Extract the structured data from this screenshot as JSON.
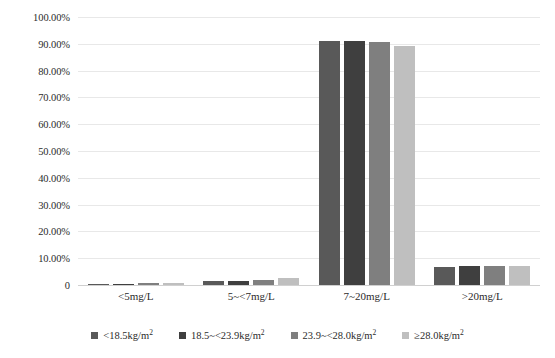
{
  "chart_data": {
    "type": "bar",
    "title": "",
    "xlabel": "",
    "ylabel": "",
    "ylim": [
      0,
      1.0
    ],
    "grid": true,
    "legend_position": "bottom",
    "categories": [
      "<5mg/L",
      "5~<7mg/L",
      "7~20mg/L",
      ">20mg/L"
    ],
    "ytick_labels": [
      "100.00%",
      "90.00%",
      "80.00%",
      "70.00%",
      "60.00%",
      "50.00%",
      "40.00%",
      "30.00%",
      "20.00%",
      "10.00%",
      "0"
    ],
    "ytick_values": [
      1.0,
      0.9,
      0.8,
      0.7,
      0.6,
      0.5,
      0.4,
      0.3,
      0.2,
      0.1,
      0
    ],
    "series": [
      {
        "name": "<18.5kg/m2",
        "name_base": "<18.5kg/m",
        "name_sup": "2",
        "color": "#595959",
        "values": [
          0.003,
          0.015,
          0.912,
          0.069
        ],
        "value_labels": [
          "0.30%",
          "1.50%",
          "91.20%",
          "6.90%"
        ]
      },
      {
        "name": "18.5~<23.9kg/m2",
        "name_base": "18.5~<23.9kg/m",
        "name_sup": "2",
        "color": "#3f3f3f",
        "values": [
          0.004,
          0.016,
          0.912,
          0.07
        ],
        "value_labels": [
          "0.40%",
          "1.60%",
          "91.20%",
          "7.00%"
        ]
      },
      {
        "name": "23.9~<28.0kg/m2",
        "name_base": "23.9~<28.0kg/m",
        "name_sup": "2",
        "color": "#7f7f7f",
        "values": [
          0.006,
          0.018,
          0.907,
          0.07
        ],
        "value_labels": [
          "0.60%",
          "1.80%",
          "90.70%",
          "7.00%"
        ]
      },
      {
        "name": "≥28.0kg/m2",
        "name_base": "≥28.0kg/m",
        "name_sup": "2",
        "color": "#bfbfbf",
        "values": [
          0.008,
          0.026,
          0.89,
          0.071
        ],
        "value_labels": [
          "0.80%",
          "2.60%",
          "89.00%",
          "7.10%"
        ]
      }
    ]
  },
  "colors": {
    "gridline": "#e8e8e8",
    "baseline": "#d0d0d0",
    "text": "#2b2b2b",
    "background": "#ffffff"
  }
}
